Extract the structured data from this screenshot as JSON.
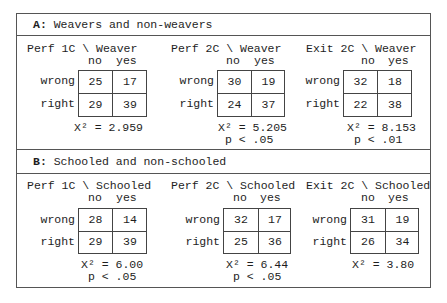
{
  "sections": [
    {
      "label": "A:",
      "title": "Weavers and non-weavers",
      "tables": [
        {
          "title": "Perf 1C \\ Weaver",
          "col_headers": [
            "no",
            "yes"
          ],
          "rows": [
            {
              "label": "wrong",
              "values": [
                "25",
                "17"
              ]
            },
            {
              "label": "right",
              "values": [
                "29",
                "39"
              ]
            }
          ],
          "chi_sq": "X² = 2.959",
          "p": ""
        },
        {
          "title": "Perf 2C \\ Weaver",
          "col_headers": [
            "no",
            "yes"
          ],
          "rows": [
            {
              "label": "wrong",
              "values": [
                "30",
                "19"
              ]
            },
            {
              "label": "right",
              "values": [
                "24",
                "37"
              ]
            }
          ],
          "chi_sq": "X² = 5.205",
          "p": "p < .05"
        },
        {
          "title": "Exit 2C \\ Weaver",
          "col_headers": [
            "no",
            "yes"
          ],
          "rows": [
            {
              "label": "wrong",
              "values": [
                "32",
                "18"
              ]
            },
            {
              "label": "right",
              "values": [
                "22",
                "38"
              ]
            }
          ],
          "chi_sq": "X² = 8.153",
          "p": "p < .01"
        }
      ]
    },
    {
      "label": "B:",
      "title": "Schooled and non-schooled",
      "tables": [
        {
          "title": "Perf 1C \\ Schooled",
          "col_headers": [
            "no",
            "yes"
          ],
          "rows": [
            {
              "label": "wrong",
              "values": [
                "28",
                "14"
              ]
            },
            {
              "label": "right",
              "values": [
                "29",
                "39"
              ]
            }
          ],
          "chi_sq": "X² = 6.00",
          "p": "p < .05"
        },
        {
          "title": "Perf 2C \\ Schooled",
          "col_headers": [
            "no",
            "yes"
          ],
          "rows": [
            {
              "label": "wrong",
              "values": [
                "32",
                "17"
              ]
            },
            {
              "label": "right",
              "values": [
                "25",
                "36"
              ]
            }
          ],
          "chi_sq": "X² = 6.44",
          "p": "p < .05"
        },
        {
          "title": "Exit 2C \\ Schooled",
          "col_headers": [
            "no",
            "yes"
          ],
          "rows": [
            {
              "label": "wrong",
              "values": [
                "31",
                "19"
              ]
            },
            {
              "label": "right",
              "values": [
                "26",
                "34"
              ]
            }
          ],
          "chi_sq": "X² = 3.80",
          "p": ""
        }
      ]
    }
  ]
}
